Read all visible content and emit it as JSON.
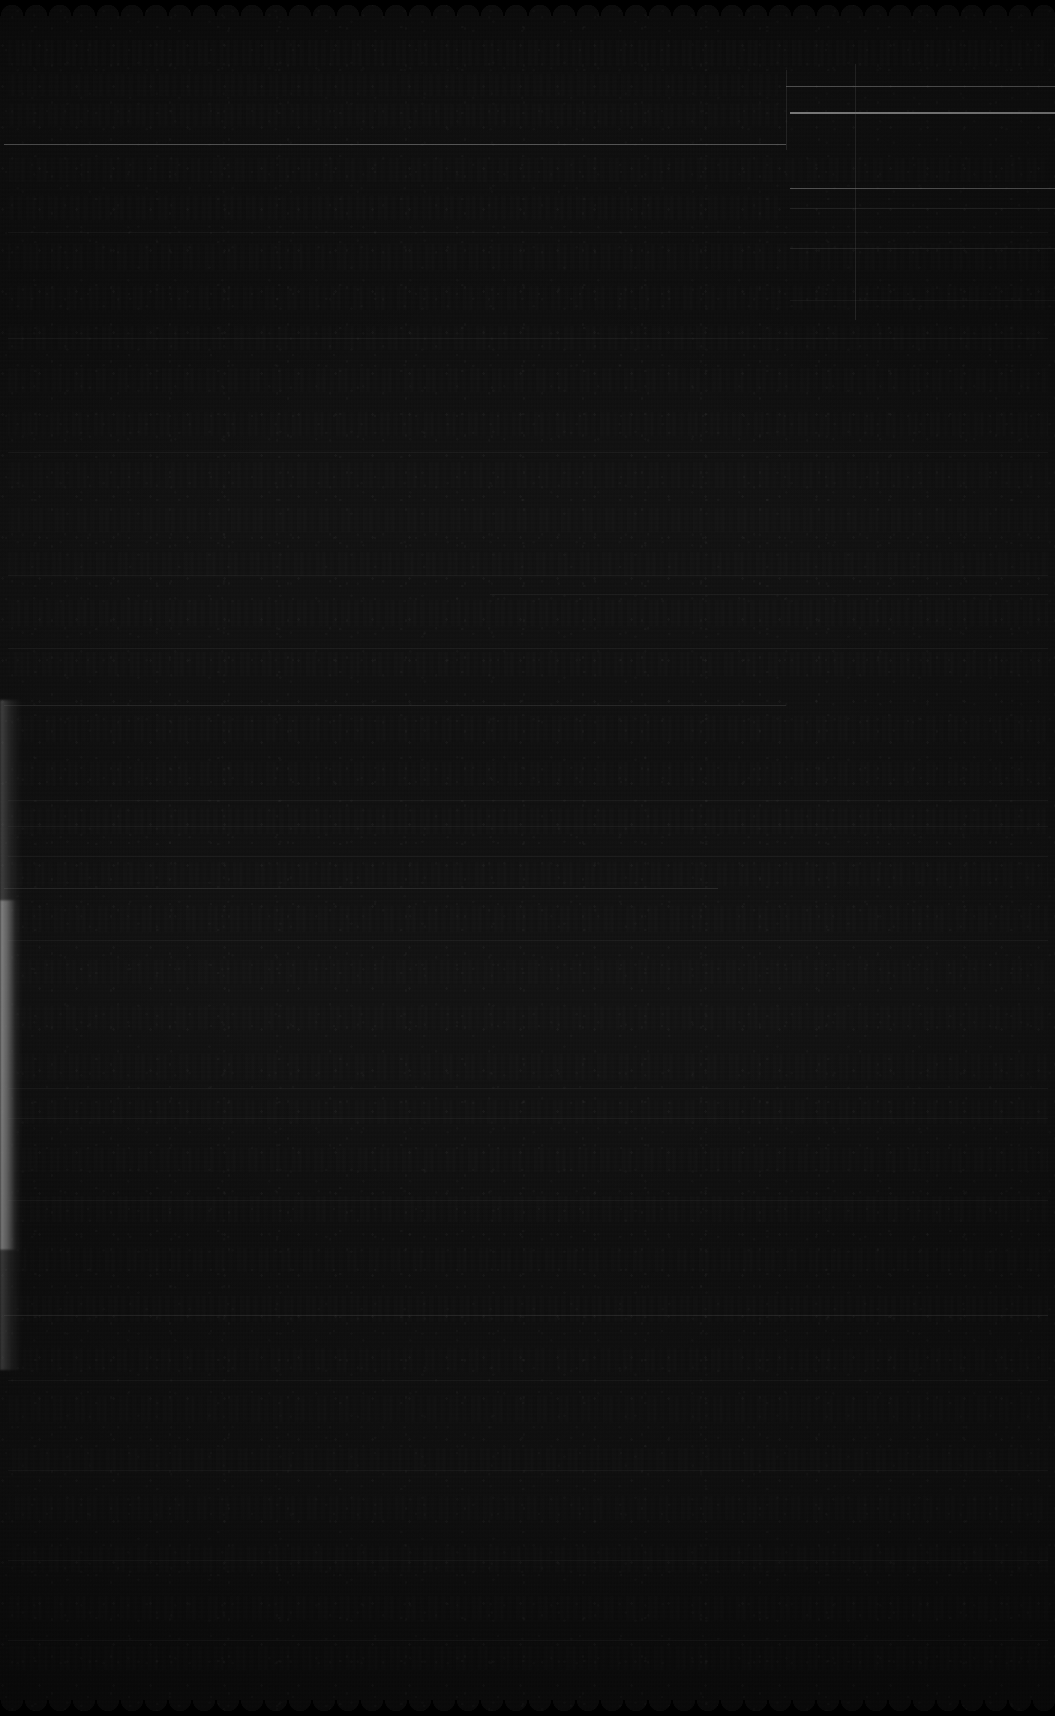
{
  "document": {
    "kind": "scanned-ruled-ledger-page",
    "legibility": "illegible",
    "exposure": "severely-underexposed",
    "visible_text": "",
    "page_width_px": 1055,
    "page_height_px": 1716
  },
  "appearance": {
    "paper_color": "#181818",
    "darkest_color": "#0b0b0b",
    "lightest_color": "#e8e8e8",
    "rule_color": "#ebebeb",
    "edge_leak_color": "#ffffff",
    "background_color": "#000000"
  },
  "edges": {
    "top_edge": "scalloped",
    "bottom_edge": "scalloped",
    "left_edge": "light-leak-strip",
    "right_edge": "straight"
  },
  "structure": {
    "column_divider_x": 855,
    "left_column_right_edge": 786,
    "text_block_left": 10,
    "text_block_right": 1045
  },
  "rules": [
    {
      "name": "rule-right-1",
      "x": 786,
      "y": 86,
      "width": 269,
      "weight": "normal"
    },
    {
      "name": "rule-right-2",
      "x": 790,
      "y": 112,
      "width": 265,
      "weight": "bright"
    },
    {
      "name": "rule-left-1",
      "x": 4,
      "y": 144,
      "width": 782,
      "weight": "normal"
    },
    {
      "name": "rule-right-3",
      "x": 790,
      "y": 188,
      "width": 265,
      "weight": "normal"
    },
    {
      "name": "rule-right-4",
      "x": 790,
      "y": 208,
      "width": 265,
      "weight": "faint"
    },
    {
      "name": "rule-body-1",
      "x": 8,
      "y": 232,
      "width": 1040,
      "weight": "vfaint"
    },
    {
      "name": "rule-right-5",
      "x": 790,
      "y": 248,
      "width": 265,
      "weight": "faint"
    },
    {
      "name": "rule-right-6",
      "x": 790,
      "y": 300,
      "width": 265,
      "weight": "vfaint"
    },
    {
      "name": "rule-body-2",
      "x": 8,
      "y": 338,
      "width": 1040,
      "weight": "vfaint"
    },
    {
      "name": "rule-body-3",
      "x": 8,
      "y": 452,
      "width": 1040,
      "weight": "vfaint"
    },
    {
      "name": "rule-body-4",
      "x": 8,
      "y": 575,
      "width": 1040,
      "weight": "vfaint"
    },
    {
      "name": "rule-body-5",
      "x": 490,
      "y": 594,
      "width": 558,
      "weight": "vfaint"
    },
    {
      "name": "rule-body-6",
      "x": 8,
      "y": 648,
      "width": 1040,
      "weight": "vfaint"
    },
    {
      "name": "rule-body-7",
      "x": 4,
      "y": 705,
      "width": 782,
      "weight": "faint"
    },
    {
      "name": "rule-body-8",
      "x": 8,
      "y": 800,
      "width": 1040,
      "weight": "vfaint"
    },
    {
      "name": "rule-body-9",
      "x": 8,
      "y": 826,
      "width": 1040,
      "weight": "vfaint"
    },
    {
      "name": "rule-body-10",
      "x": 8,
      "y": 856,
      "width": 1040,
      "weight": "vfaint"
    },
    {
      "name": "rule-body-11",
      "x": 4,
      "y": 888,
      "width": 714,
      "weight": "faint"
    },
    {
      "name": "rule-body-12",
      "x": 8,
      "y": 940,
      "width": 1040,
      "weight": "vfaint"
    },
    {
      "name": "rule-body-13",
      "x": 8,
      "y": 1088,
      "width": 1040,
      "weight": "vfaint"
    },
    {
      "name": "rule-body-14",
      "x": 8,
      "y": 1118,
      "width": 1040,
      "weight": "vfaint"
    },
    {
      "name": "rule-body-15",
      "x": 8,
      "y": 1200,
      "width": 1040,
      "weight": "vfaint"
    },
    {
      "name": "rule-body-16",
      "x": 4,
      "y": 1315,
      "width": 1044,
      "weight": "faint"
    },
    {
      "name": "rule-body-17",
      "x": 8,
      "y": 1380,
      "width": 1040,
      "weight": "vfaint"
    },
    {
      "name": "rule-body-18",
      "x": 8,
      "y": 1470,
      "width": 1040,
      "weight": "vfaint"
    },
    {
      "name": "rule-body-19",
      "x": 8,
      "y": 1560,
      "width": 1040,
      "weight": "vfaint"
    },
    {
      "name": "rule-body-20",
      "x": 8,
      "y": 1640,
      "width": 1040,
      "weight": "vfaint"
    }
  ],
  "vertical_rules": [
    {
      "name": "column-divider",
      "x": 855,
      "y": 64,
      "height": 256
    },
    {
      "name": "margin-line",
      "x": 786,
      "y": 70,
      "height": 80
    }
  ],
  "text_rows": [
    {
      "name": "text-row-1",
      "y": 40,
      "height": 26,
      "width": 1040,
      "opacity": 0.3
    },
    {
      "name": "text-row-2",
      "y": 74,
      "height": 22,
      "width": 770,
      "opacity": 0.26
    },
    {
      "name": "text-row-3",
      "y": 104,
      "height": 22,
      "width": 770,
      "opacity": 0.28
    },
    {
      "name": "text-row-4",
      "y": 158,
      "height": 24,
      "width": 1040,
      "opacity": 0.24
    },
    {
      "name": "text-row-5",
      "y": 196,
      "height": 24,
      "width": 770,
      "opacity": 0.26
    },
    {
      "name": "text-row-6",
      "y": 244,
      "height": 26,
      "width": 1040,
      "opacity": 0.22
    },
    {
      "name": "text-row-7",
      "y": 286,
      "height": 24,
      "width": 1040,
      "opacity": 0.25
    },
    {
      "name": "text-row-8",
      "y": 326,
      "height": 24,
      "width": 1040,
      "opacity": 0.23
    },
    {
      "name": "text-row-9",
      "y": 368,
      "height": 24,
      "width": 1040,
      "opacity": 0.24
    },
    {
      "name": "text-row-10",
      "y": 412,
      "height": 24,
      "width": 1040,
      "opacity": 0.22
    },
    {
      "name": "text-row-11",
      "y": 462,
      "height": 26,
      "width": 1040,
      "opacity": 0.25
    },
    {
      "name": "text-row-12",
      "y": 508,
      "height": 24,
      "width": 1040,
      "opacity": 0.23
    },
    {
      "name": "text-row-13",
      "y": 552,
      "height": 24,
      "width": 1040,
      "opacity": 0.24
    },
    {
      "name": "text-row-14",
      "y": 600,
      "height": 26,
      "width": 1040,
      "opacity": 0.26
    },
    {
      "name": "text-row-15",
      "y": 652,
      "height": 24,
      "width": 1040,
      "opacity": 0.23
    },
    {
      "name": "text-row-16",
      "y": 716,
      "height": 26,
      "width": 1040,
      "opacity": 0.25
    },
    {
      "name": "text-row-17",
      "y": 762,
      "height": 24,
      "width": 1040,
      "opacity": 0.24
    },
    {
      "name": "text-row-18",
      "y": 808,
      "height": 26,
      "width": 1040,
      "opacity": 0.27
    },
    {
      "name": "text-row-19",
      "y": 862,
      "height": 24,
      "width": 1040,
      "opacity": 0.25
    },
    {
      "name": "text-row-20",
      "y": 906,
      "height": 26,
      "width": 1040,
      "opacity": 0.24
    },
    {
      "name": "text-row-21",
      "y": 960,
      "height": 24,
      "width": 1040,
      "opacity": 0.22
    },
    {
      "name": "text-row-22",
      "y": 1006,
      "height": 24,
      "width": 1040,
      "opacity": 0.23
    },
    {
      "name": "text-row-23",
      "y": 1054,
      "height": 26,
      "width": 1040,
      "opacity": 0.25
    },
    {
      "name": "text-row-24",
      "y": 1100,
      "height": 24,
      "width": 1040,
      "opacity": 0.24
    },
    {
      "name": "text-row-25",
      "y": 1148,
      "height": 24,
      "width": 1040,
      "opacity": 0.23
    },
    {
      "name": "text-row-26",
      "y": 1196,
      "height": 26,
      "width": 1040,
      "opacity": 0.25
    },
    {
      "name": "text-row-27",
      "y": 1248,
      "height": 24,
      "width": 1040,
      "opacity": 0.24
    },
    {
      "name": "text-row-28",
      "y": 1296,
      "height": 26,
      "width": 1040,
      "opacity": 0.26
    },
    {
      "name": "text-row-29",
      "y": 1348,
      "height": 24,
      "width": 1040,
      "opacity": 0.24
    },
    {
      "name": "text-row-30",
      "y": 1396,
      "height": 26,
      "width": 1040,
      "opacity": 0.25
    },
    {
      "name": "text-row-31",
      "y": 1448,
      "height": 24,
      "width": 1040,
      "opacity": 0.23
    },
    {
      "name": "text-row-32",
      "y": 1496,
      "height": 24,
      "width": 1040,
      "opacity": 0.24
    },
    {
      "name": "text-row-33",
      "y": 1546,
      "height": 26,
      "width": 1040,
      "opacity": 0.25
    },
    {
      "name": "text-row-34",
      "y": 1596,
      "height": 24,
      "width": 1040,
      "opacity": 0.23
    },
    {
      "name": "text-row-35",
      "y": 1646,
      "height": 24,
      "width": 1040,
      "opacity": 0.22
    }
  ],
  "light_leaks": [
    {
      "name": "edge-leak-upper",
      "y": 700,
      "height": 200,
      "intensity": "soft"
    },
    {
      "name": "edge-leak-main",
      "y": 900,
      "height": 350,
      "intensity": "bright"
    },
    {
      "name": "edge-leak-lower",
      "y": 1250,
      "height": 120,
      "intensity": "soft"
    }
  ]
}
